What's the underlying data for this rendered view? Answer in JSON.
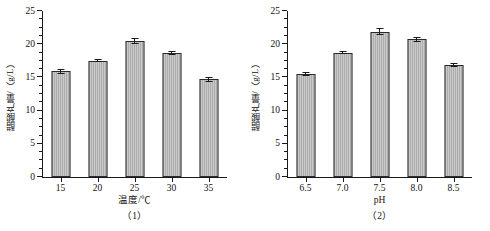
{
  "figure": {
    "background": "#ffffff",
    "bar_fill": "#c9c9c9",
    "bar_edge": "#2b2b2b",
    "axis_color": "#1a1a1a"
  },
  "chart_data": [
    {
      "type": "bar",
      "panel_label": "（1）",
      "title": "",
      "xlabel": "温度/℃",
      "ylabel": "醋酸产量/（g/L）",
      "categories": [
        "15",
        "20",
        "25",
        "30",
        "35"
      ],
      "values": [
        15.9,
        17.5,
        20.5,
        18.75,
        14.7
      ],
      "errors": [
        0.35,
        0.22,
        0.45,
        0.3,
        0.38
      ],
      "ylim": [
        0,
        25
      ],
      "yticks": [
        0,
        5,
        10,
        15,
        20,
        25
      ],
      "ytick_labels": [
        "0",
        "5",
        "10",
        "15",
        "20",
        "25"
      ],
      "yminor_step": 1.25,
      "grid": false,
      "legend": false
    },
    {
      "type": "bar",
      "panel_label": "（2）",
      "title": "",
      "xlabel": "pH",
      "ylabel": "醋酸产量/（g/L）",
      "categories": [
        "6.5",
        "7.0",
        "7.5",
        "8.0",
        "8.5"
      ],
      "values": [
        15.5,
        18.75,
        21.9,
        20.75,
        16.8
      ],
      "errors": [
        0.35,
        0.25,
        0.5,
        0.4,
        0.3
      ],
      "ylim": [
        0,
        25
      ],
      "yticks": [
        0,
        5,
        10,
        15,
        20,
        25
      ],
      "ytick_labels": [
        "0",
        "5",
        "10",
        "15",
        "20",
        "25"
      ],
      "yminor_step": 1.25,
      "grid": false,
      "legend": false
    }
  ]
}
